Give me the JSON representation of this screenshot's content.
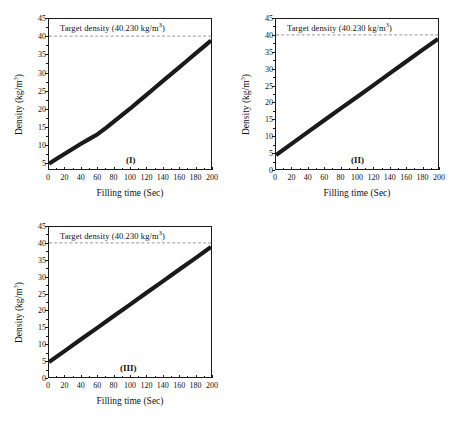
{
  "figure": {
    "panel_count": 3
  },
  "chart_data": [
    {
      "type": "line",
      "panel_tag": "(I)",
      "title": "",
      "xlabel": "Filling time (Sec)",
      "ylabel_text": "Density (kg/m",
      "ylabel_sup": "3",
      "ylabel_tail": ")",
      "xlim": [
        0,
        200
      ],
      "ylim": [
        3.2,
        45
      ],
      "xticks": [
        0,
        20,
        40,
        60,
        80,
        100,
        120,
        140,
        160,
        180,
        200
      ],
      "yticks": [
        5,
        10,
        15,
        20,
        25,
        30,
        35,
        40,
        45
      ],
      "grid": false,
      "legend": "none",
      "annotation": {
        "text_before": "Target density (40.230 kg/m",
        "text_sup": "3",
        "text_after": ")",
        "value": 40.23,
        "style": "dashed-horizontal-line"
      },
      "series": [
        {
          "name": "Density vs filling time (I)",
          "x": [
            0,
            10,
            20,
            30,
            40,
            50,
            60,
            70,
            80,
            90,
            100,
            110,
            120,
            130,
            140,
            150,
            160,
            170,
            180,
            190,
            200
          ],
          "values": [
            4.7,
            6.1,
            7.5,
            8.9,
            10.3,
            11.6,
            12.9,
            14.6,
            16.4,
            18.2,
            20.0,
            21.9,
            23.8,
            25.7,
            27.6,
            29.5,
            31.4,
            33.3,
            35.2,
            37.1,
            39.0
          ]
        }
      ]
    },
    {
      "type": "line",
      "panel_tag": "(II)",
      "title": "",
      "xlabel": "Filling time (Sec)",
      "ylabel_text": "Density (kg/m",
      "ylabel_sup": "3",
      "ylabel_tail": ")",
      "xlim": [
        0,
        200
      ],
      "ylim": [
        0,
        45
      ],
      "xticks": [
        0,
        20,
        40,
        60,
        80,
        100,
        120,
        140,
        160,
        180,
        200
      ],
      "yticks": [
        0,
        5,
        10,
        15,
        20,
        25,
        30,
        35,
        40,
        45
      ],
      "grid": false,
      "legend": "none",
      "annotation": {
        "text_before": "Target density (40.230 kg/m",
        "text_sup": "3",
        "text_after": ")",
        "value": 40.23,
        "style": "dashed-horizontal-line"
      },
      "series": [
        {
          "name": "Density vs filling time (II)",
          "x": [
            0,
            20,
            40,
            60,
            80,
            100,
            120,
            140,
            160,
            180,
            200
          ],
          "values": [
            4.2,
            7.7,
            11.2,
            14.7,
            18.2,
            21.6,
            25.1,
            28.6,
            32.1,
            35.6,
            39.0
          ]
        }
      ]
    },
    {
      "type": "line",
      "panel_tag": "(III)",
      "title": "",
      "xlabel": "Filling time (Sec)",
      "ylabel_text": "Density (kg/m",
      "ylabel_sup": "3",
      "ylabel_tail": ")",
      "xlim": [
        0,
        200
      ],
      "ylim": [
        0,
        45
      ],
      "xticks": [
        0,
        20,
        40,
        60,
        80,
        100,
        120,
        140,
        160,
        180,
        200
      ],
      "yticks": [
        0,
        5,
        10,
        15,
        20,
        25,
        30,
        35,
        40,
        45
      ],
      "grid": false,
      "legend": "none",
      "annotation": {
        "text_before": "Target density (40.230 kg/m",
        "text_sup": "3",
        "text_after": ")",
        "value": 40.23,
        "style": "dashed-horizontal-line"
      },
      "series": [
        {
          "name": "Density vs filling time (III)",
          "x": [
            0,
            20,
            40,
            60,
            80,
            100,
            120,
            140,
            160,
            180,
            200
          ],
          "values": [
            4.5,
            7.9,
            11.4,
            14.8,
            18.3,
            21.7,
            25.2,
            28.6,
            32.1,
            35.5,
            39.0
          ]
        }
      ]
    }
  ],
  "colors": {
    "line": "#1a1a1a",
    "axis": "#1a1a1a",
    "target_line": "#8a8a8a",
    "background": "#ffffff"
  }
}
